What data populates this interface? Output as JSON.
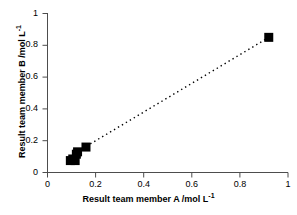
{
  "chart_data": {
    "type": "scatter",
    "title": "",
    "xlabel": "Result team member  A /mol L",
    "xlabel_sup": "-1",
    "ylabel": "Result team member  B /mol L",
    "ylabel_sup": "-1",
    "xlim": [
      0,
      1
    ],
    "ylim": [
      0,
      1
    ],
    "grid": false,
    "legend": "none",
    "marker": "square",
    "marker_color": "#000000",
    "xticks": [
      "0",
      "0.2",
      "0.4",
      "0.6",
      "0.8",
      "1"
    ],
    "xtick_values": [
      0,
      0.2,
      0.4,
      0.6,
      0.8,
      1
    ],
    "yticks": [
      "0",
      "0.2",
      "0.4",
      "0.6",
      "0.8",
      "1"
    ],
    "ytick_values": [
      0,
      0.2,
      0.4,
      0.6,
      0.8,
      1
    ],
    "series": [
      {
        "name": "measurements",
        "points": [
          {
            "x": 0.095,
            "y": 0.075
          },
          {
            "x": 0.105,
            "y": 0.085
          },
          {
            "x": 0.115,
            "y": 0.075
          },
          {
            "x": 0.12,
            "y": 0.115
          },
          {
            "x": 0.125,
            "y": 0.13
          },
          {
            "x": 0.16,
            "y": 0.16
          },
          {
            "x": 0.92,
            "y": 0.85
          }
        ]
      }
    ],
    "trendline": {
      "style": "dotted",
      "color": "#000000",
      "x0": 0.145,
      "y0": 0.15,
      "x1": 0.915,
      "y1": 0.845
    }
  },
  "axes": {
    "x_axis_name": "x-axis",
    "y_axis_name": "y-axis"
  }
}
